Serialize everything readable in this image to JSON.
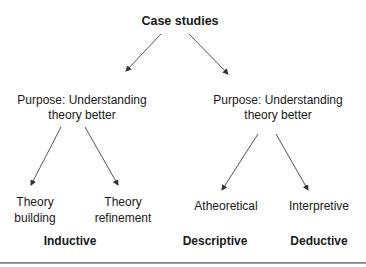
{
  "diagram": {
    "root": "Case studies",
    "branches": [
      {
        "purpose_line1": "Purpose: Understanding",
        "purpose_line2": "theory better",
        "children": [
          {
            "line1": "Theory",
            "line2": "building"
          },
          {
            "line1": "Theory",
            "line2": "refinement"
          }
        ],
        "category": "Inductive"
      },
      {
        "purpose_line1": "Purpose: Understanding",
        "purpose_line2": "theory better",
        "children": [
          {
            "line1": "Atheoretical"
          },
          {
            "line1": "Interpretive"
          }
        ],
        "categories": [
          "Descriptive",
          "Deductive"
        ]
      }
    ],
    "colors": {
      "text": "#1a1a1a",
      "arrow": "#555555",
      "rule": "#888888"
    }
  }
}
